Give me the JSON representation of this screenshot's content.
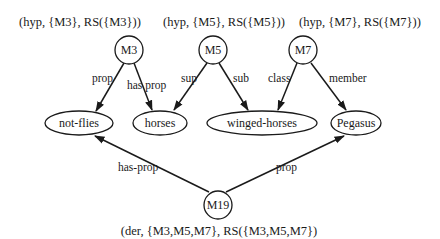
{
  "diagram": {
    "type": "semantic-network",
    "colors": {
      "ink": "#1a1a1a",
      "background": "#ffffff"
    },
    "assertion_labels": {
      "m3": "(hyp, {M3}, RS({M3}))",
      "m5": "(hyp, {M5}, RS({M5}))",
      "m7": "(hyp, {M7}, RS({M7}))",
      "m19": "(der, {M3,M5,M7}, RS({M3,M5,M7})"
    },
    "molecular_nodes": {
      "m3": "M3",
      "m5": "M5",
      "m7": "M7",
      "m19": "M19"
    },
    "base_nodes": {
      "not_flies": "not-flies",
      "horses": "horses",
      "winged_horses": "winged-horses",
      "pegasus": "Pegasus"
    },
    "edges": [
      {
        "from": "M3",
        "to": "not-flies",
        "label": "prop"
      },
      {
        "from": "M3",
        "to": "horses",
        "label": "has prop"
      },
      {
        "from": "M5",
        "to": "horses",
        "label": "sup"
      },
      {
        "from": "M5",
        "to": "winged-horses",
        "label": "sub"
      },
      {
        "from": "M7",
        "to": "winged-horses",
        "label": "class"
      },
      {
        "from": "M7",
        "to": "Pegasus",
        "label": "member"
      },
      {
        "from": "M19",
        "to": "not-flies",
        "label": "has-prop"
      },
      {
        "from": "M19",
        "to": "Pegasus",
        "label": "prop"
      }
    ]
  }
}
